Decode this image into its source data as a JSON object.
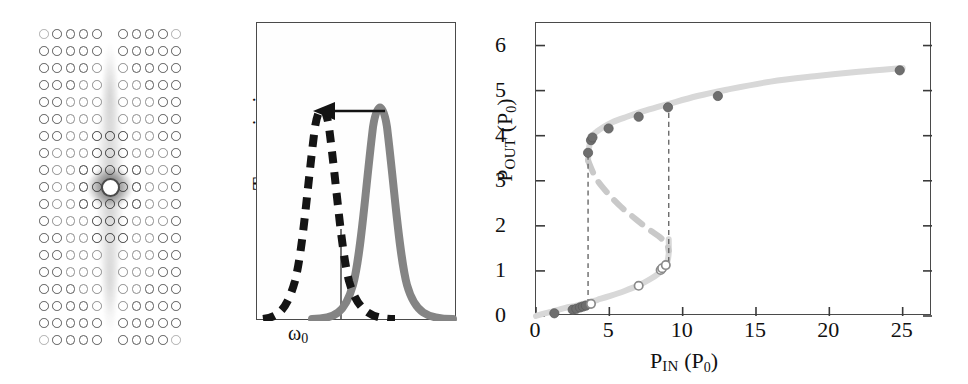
{
  "figure": {
    "panels": [
      "photonic-crystal-field-map",
      "transmission-spectrum",
      "input-output-bistability"
    ]
  },
  "panel_a": {
    "name": "photonic-crystal-field-map",
    "lattice": {
      "columns": 11,
      "rows": 19,
      "missing_column_index": 5
    },
    "defect": {
      "label": "central-cavity-defect"
    },
    "colors": {
      "hole_stroke": "#5a5a5a",
      "field_glow": "#3c3c3c",
      "background": "#ffffff"
    }
  },
  "panel_b": {
    "name": "transmission-spectrum",
    "ylabel": "Transmission",
    "xlabel_omega": "ω",
    "xlabel_sub": "0",
    "curves": [
      {
        "name": "low-power-resonance",
        "style": "solid",
        "color": "#808080",
        "center_frac": 0.62
      },
      {
        "name": "shifted-resonance",
        "style": "dashed",
        "color": "#1a1a1a",
        "center_frac": 0.33
      }
    ],
    "annotation": {
      "name": "redshift-arrow",
      "direction": "left"
    },
    "marker": {
      "name": "omega0-tick",
      "x_frac": 0.42
    }
  },
  "chart_data": {
    "type": "scatter",
    "title": "",
    "xlabel": "P_IN (P_0)",
    "ylabel": "P_OUT (P_0)",
    "xlabel_main": "P",
    "xlabel_sub": "IN",
    "xlabel_unit_main": "P",
    "xlabel_unit_sub": "0",
    "ylabel_main": "P",
    "ylabel_sub": "OUT",
    "ylabel_unit_main": "P",
    "ylabel_unit_sub": "0",
    "xlim": [
      0,
      27
    ],
    "ylim": [
      0,
      6.5
    ],
    "xticks": [
      0,
      5,
      10,
      15,
      20,
      25
    ],
    "yticks": [
      0,
      1,
      2,
      3,
      4,
      5,
      6
    ],
    "grid": false,
    "legend": "none",
    "series": [
      {
        "name": "lower-branch-theory",
        "style": "solid-thick",
        "color": "#d8d8d8",
        "points": [
          [
            0,
            0
          ],
          [
            0.6,
            0.06
          ],
          [
            1.2,
            0.11
          ],
          [
            2,
            0.18
          ],
          [
            2.6,
            0.22
          ],
          [
            3.1,
            0.26
          ],
          [
            3.6,
            0.3
          ],
          [
            4.2,
            0.36
          ],
          [
            5,
            0.44
          ],
          [
            6,
            0.55
          ],
          [
            7,
            0.68
          ],
          [
            7.8,
            0.82
          ],
          [
            8.3,
            0.93
          ],
          [
            8.7,
            1.05
          ],
          [
            8.95,
            1.2
          ],
          [
            9.05,
            1.4
          ],
          [
            9.05,
            1.7
          ]
        ]
      },
      {
        "name": "upper-branch-theory",
        "style": "solid-thick",
        "color": "#d8d8d8",
        "points": [
          [
            3.55,
            3.45
          ],
          [
            3.6,
            3.7
          ],
          [
            3.75,
            3.92
          ],
          [
            4.0,
            4.05
          ],
          [
            4.5,
            4.17
          ],
          [
            5.2,
            4.3
          ],
          [
            6.2,
            4.42
          ],
          [
            7.5,
            4.56
          ],
          [
            9,
            4.7
          ],
          [
            11,
            4.88
          ],
          [
            13,
            5.02
          ],
          [
            16,
            5.2
          ],
          [
            19,
            5.32
          ],
          [
            22,
            5.42
          ],
          [
            25,
            5.5
          ]
        ]
      },
      {
        "name": "unstable-branch",
        "style": "dashed-thick",
        "color": "#c9c9c9",
        "points": [
          [
            3.55,
            3.45
          ],
          [
            4.1,
            3.05
          ],
          [
            4.9,
            2.72
          ],
          [
            5.8,
            2.42
          ],
          [
            6.8,
            2.15
          ],
          [
            7.7,
            1.92
          ],
          [
            8.4,
            1.76
          ],
          [
            8.9,
            1.6
          ],
          [
            9.05,
            1.45
          ]
        ]
      },
      {
        "name": "upward-switch-jump",
        "style": "dashed-thin",
        "color": "#6a6a6a",
        "points": [
          [
            9.05,
            1.2
          ],
          [
            9.05,
            4.68
          ]
        ]
      },
      {
        "name": "downward-switch-jump",
        "style": "dashed-thin",
        "color": "#6a6a6a",
        "points": [
          [
            3.55,
            0.27
          ],
          [
            3.55,
            3.62
          ]
        ]
      },
      {
        "name": "increasing-power-data",
        "style": "filled-circles",
        "color": "#6e6e6e",
        "points": [
          [
            1.25,
            0.06
          ],
          [
            2.5,
            0.14
          ],
          [
            2.75,
            0.16
          ],
          [
            3.0,
            0.19
          ],
          [
            3.2,
            0.21
          ],
          [
            3.4,
            0.23
          ],
          [
            3.55,
            3.62
          ],
          [
            3.75,
            3.9
          ],
          [
            3.85,
            3.96
          ],
          [
            4.95,
            4.16
          ],
          [
            7.0,
            4.42
          ],
          [
            9.0,
            4.63
          ],
          [
            12.4,
            4.88
          ],
          [
            24.8,
            5.45
          ]
        ]
      },
      {
        "name": "decreasing-power-data",
        "style": "hollow-circles",
        "color": "#8a8a8a",
        "points": [
          [
            3.75,
            0.27
          ],
          [
            7.0,
            0.67
          ],
          [
            8.5,
            1.02
          ],
          [
            8.6,
            1.06
          ],
          [
            8.85,
            1.13
          ]
        ]
      }
    ]
  }
}
